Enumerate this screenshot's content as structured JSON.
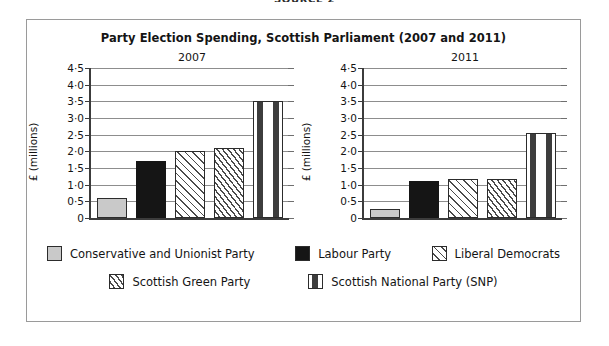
{
  "source_caption": "SOURCE 2",
  "figure": {
    "title": "Party Election Spending, Scottish Parliament (2007 and 2011)"
  },
  "axis": {
    "y_caption": "£ (millions)",
    "ticks": [
      "4·5",
      "4·0",
      "3·5",
      "3·0",
      "2·5",
      "2·0",
      "1·5",
      "1·0",
      "0·5",
      "0"
    ]
  },
  "panels": [
    {
      "title": "2007"
    },
    {
      "title": "2011"
    }
  ],
  "legend": {
    "row1": [
      {
        "label": "Conservative and Unionist Party",
        "pattern": "solid-grey"
      },
      {
        "label": "Labour Party",
        "pattern": "solid-black"
      },
      {
        "label": "Liberal Democrats",
        "pattern": "hatch-sparse"
      }
    ],
    "row2": [
      {
        "label": "Scottish Green Party",
        "pattern": "hatch-dense"
      },
      {
        "label": "Scottish National Party (SNP)",
        "pattern": "dashed"
      }
    ]
  },
  "colors": {
    "conservative": "#c9c9c9",
    "labour": "#151515",
    "hatch_line": "#4a4a4a",
    "frame": "#9a9a9a",
    "gridline": "#8d8d8d",
    "axis": "#3c3c3c"
  },
  "chart_data": {
    "type": "bar",
    "title": "Party Election Spending, Scottish Parliament (2007 and 2011)",
    "xlabel": "",
    "ylabel": "£ (millions)",
    "ylim": [
      0,
      4.5
    ],
    "ytick_values": [
      0,
      0.5,
      1.0,
      1.5,
      2.0,
      2.5,
      3.0,
      3.5,
      4.0,
      4.5
    ],
    "ytick_labels": [
      "0",
      "0·5",
      "1·0",
      "1·5",
      "2·0",
      "2·5",
      "3·0",
      "3·5",
      "4·0",
      "4·5"
    ],
    "grid": true,
    "legend_position": "bottom",
    "panels": [
      "2007",
      "2011"
    ],
    "categories": [
      "Conservative and Unionist Party",
      "Labour Party",
      "Liberal Democrats",
      "Scottish Green Party",
      "Scottish National Party (SNP)"
    ],
    "series": [
      {
        "name": "2007",
        "values": [
          0.6,
          1.7,
          2.0,
          2.1,
          3.5
        ]
      },
      {
        "name": "2011",
        "values": [
          0.27,
          1.1,
          1.18,
          1.18,
          2.55
        ]
      }
    ]
  }
}
